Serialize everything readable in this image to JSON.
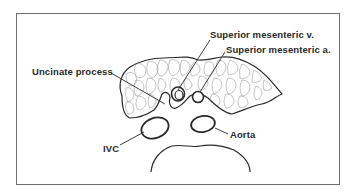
{
  "diagram": {
    "type": "anatomical cross-section",
    "labels": {
      "smv": "Superior mesenteric v.",
      "sma": "Superior mesenteric a.",
      "uncinate": "Uncinate process",
      "ivc": "IVC",
      "aorta": "Aorta"
    },
    "structures": [
      "pancreas",
      "uncinate-process",
      "superior-mesenteric-vein",
      "superior-mesenteric-artery",
      "inferior-vena-cava",
      "aorta",
      "vertebral-body"
    ]
  }
}
